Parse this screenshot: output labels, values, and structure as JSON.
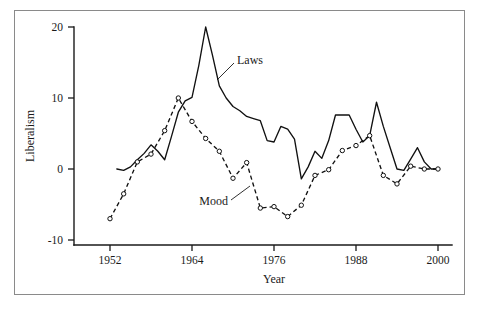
{
  "figure": {
    "background": "#ffffff",
    "frame_color": "#8a8a8a",
    "line_color": "#111111"
  },
  "chart_data": {
    "type": "line",
    "title": "",
    "subtitle": "",
    "xlabel": "Year",
    "ylabel": "Liberalism",
    "xlim": [
      1950,
      2001
    ],
    "ylim": [
      -11,
      21
    ],
    "xticks": [
      1952,
      1964,
      1976,
      1988,
      2000
    ],
    "xtick_labels": [
      "1952",
      "1964",
      "1976",
      "1988",
      "2000"
    ],
    "yticks": [
      -10,
      0,
      10,
      20
    ],
    "ytick_labels": [
      "-10",
      "0",
      "10",
      "20"
    ],
    "grid": false,
    "legend_position": "inline-annotation",
    "annotations": [
      {
        "text": "Laws",
        "x": 1970,
        "y": 15.5,
        "points_to_x": 1967.5,
        "points_to_y": 12.0
      },
      {
        "text": "Mood",
        "x": 1971.5,
        "y": -4.5,
        "points_to_x": 1974.2,
        "points_to_y": -2.2
      }
    ],
    "series": [
      {
        "name": "Laws",
        "style": "solid",
        "markers": false,
        "x": [
          1953,
          1954,
          1955,
          1956,
          1957,
          1958,
          1959,
          1960,
          1961,
          1962,
          1963,
          1964,
          1965,
          1966,
          1967,
          1968,
          1969,
          1970,
          1971,
          1972,
          1973,
          1974,
          1975,
          1976,
          1977,
          1978,
          1979,
          1980,
          1981,
          1982,
          1983,
          1984,
          1985,
          1986,
          1987,
          1988,
          1989,
          1990,
          1991,
          1992,
          1993,
          1994,
          1995,
          1996,
          1997,
          1998,
          1999,
          2000
        ],
        "values": [
          0.0,
          -0.2,
          0.3,
          1.3,
          2.2,
          3.4,
          2.5,
          1.3,
          4.6,
          8.0,
          9.6,
          10.1,
          14.6,
          20.0,
          16.0,
          11.7,
          10.0,
          8.8,
          8.2,
          7.4,
          7.1,
          6.8,
          4.0,
          3.8,
          6.0,
          5.6,
          4.2,
          -1.4,
          0.3,
          2.5,
          1.5,
          4.0,
          7.6,
          7.6,
          7.6,
          5.6,
          3.8,
          4.7,
          9.4,
          6.0,
          3.0,
          0.0,
          -0.2,
          1.4,
          3.0,
          1.0,
          0.0,
          0.0
        ]
      },
      {
        "name": "Mood",
        "style": "dashed",
        "markers": true,
        "x": [
          1952,
          1954,
          1956,
          1958,
          1960,
          1962,
          1964,
          1966,
          1968,
          1970,
          1972,
          1974,
          1976,
          1978,
          1980,
          1982,
          1984,
          1986,
          1988,
          1990,
          1992,
          1994,
          1996,
          1998,
          2000
        ],
        "values": [
          -7.0,
          -3.5,
          1.0,
          2.1,
          5.4,
          10.0,
          6.7,
          4.3,
          2.5,
          -1.3,
          0.9,
          -5.5,
          -5.3,
          -6.7,
          -5.1,
          -0.9,
          -0.1,
          2.6,
          3.3,
          4.7,
          -0.9,
          -2.1,
          0.4,
          0.0,
          0.0
        ]
      }
    ]
  }
}
